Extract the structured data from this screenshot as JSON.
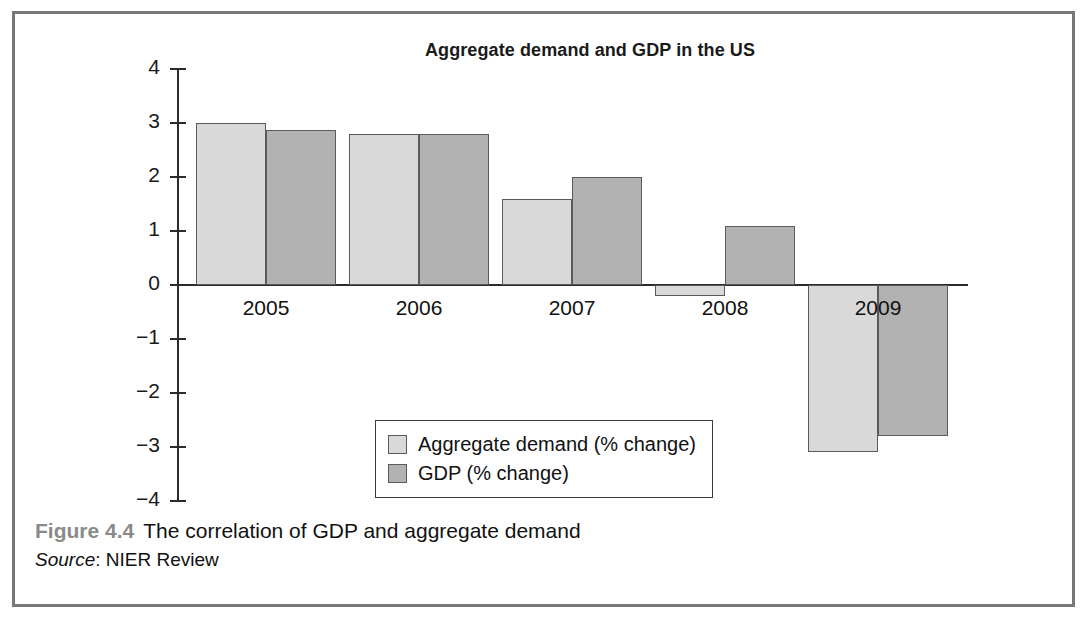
{
  "figure": {
    "number": "Figure 4.4",
    "caption": "The correlation of GDP and aggregate demand",
    "source_label": "Source",
    "source_separator": ": ",
    "source_value": "NIER Review"
  },
  "legend": {
    "entries": [
      {
        "label": "Aggregate demand (% change)",
        "color": "#d9d9d9"
      },
      {
        "label": "GDP (% change)",
        "color": "#b2b2b2"
      }
    ]
  },
  "axis": {
    "y_ticks": [
      "4",
      "3",
      "2",
      "1",
      "0",
      "−1",
      "−2",
      "−3",
      "−4"
    ],
    "x_ticks": [
      "2005",
      "2006",
      "2007",
      "2008",
      "2009"
    ]
  },
  "chart_data": {
    "type": "bar",
    "title": "Aggregate demand and GDP in the US",
    "xlabel": "",
    "ylabel": "",
    "ylim": [
      -4,
      4
    ],
    "ytick_step": 1,
    "grid": false,
    "legend_position": "inside-bottom-center",
    "categories": [
      "2005",
      "2006",
      "2007",
      "2008",
      "2009"
    ],
    "series": [
      {
        "name": "Aggregate demand (% change)",
        "color": "#d9d9d9",
        "values": [
          3.0,
          2.8,
          1.6,
          -0.2,
          -3.1
        ]
      },
      {
        "name": "GDP (% change)",
        "color": "#b2b2b2",
        "values": [
          2.87,
          2.8,
          2.0,
          1.1,
          -2.8
        ]
      }
    ]
  }
}
